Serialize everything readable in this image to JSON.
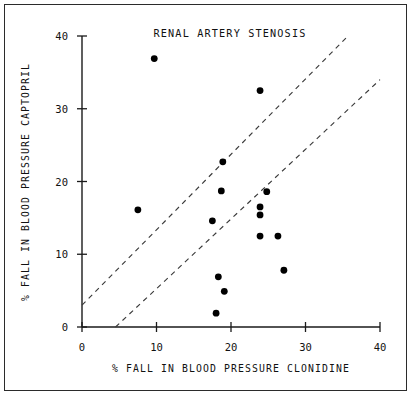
{
  "chart_data": {
    "type": "scatter",
    "title": "RENAL ARTERY STENOSIS",
    "xlabel": "% FALL IN BLOOD PRESSURE CLONIDINE",
    "ylabel": "% FALL IN BLOOD PRESSURE CAPTOPRIL",
    "xlim": [
      0,
      40
    ],
    "ylim": [
      0,
      40
    ],
    "xticks": [
      0,
      10,
      20,
      30,
      40
    ],
    "yticks": [
      0,
      10,
      20,
      30,
      40
    ],
    "xtick_labels": [
      "0",
      "10",
      "20",
      "30",
      "40"
    ],
    "ytick_labels": [
      "0",
      "10",
      "20",
      "30",
      "40"
    ],
    "grid": false,
    "legend": "none",
    "marker": "filled-circle",
    "marker_color": "#000000",
    "points": [
      {
        "x": 9.7,
        "y": 36.9
      },
      {
        "x": 23.9,
        "y": 32.5
      },
      {
        "x": 18.9,
        "y": 22.7
      },
      {
        "x": 18.7,
        "y": 18.7
      },
      {
        "x": 24.8,
        "y": 18.6
      },
      {
        "x": 7.5,
        "y": 16.1
      },
      {
        "x": 23.9,
        "y": 16.5
      },
      {
        "x": 23.9,
        "y": 15.4
      },
      {
        "x": 17.5,
        "y": 14.6
      },
      {
        "x": 23.9,
        "y": 12.5
      },
      {
        "x": 26.3,
        "y": 12.5
      },
      {
        "x": 27.1,
        "y": 7.8
      },
      {
        "x": 18.3,
        "y": 6.9
      },
      {
        "x": 19.1,
        "y": 4.9
      },
      {
        "x": 18.0,
        "y": 1.9
      }
    ],
    "reference_lines": [
      {
        "name": "upper-dashed-line",
        "style": "dashed",
        "color": "#3a3a3a",
        "x1": 0.0,
        "y1": 3.0,
        "x2": 35.7,
        "y2": 40.0
      },
      {
        "name": "lower-dashed-line",
        "style": "dashed",
        "color": "#3a3a3a",
        "x1": 4.5,
        "y1": 0.0,
        "x2": 40.0,
        "y2": 34.0
      }
    ]
  }
}
